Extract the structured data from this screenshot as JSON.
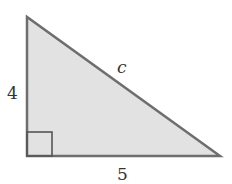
{
  "diagram": {
    "type": "right-triangle",
    "colors": {
      "fill": "#e2e2e2",
      "stroke": "#6e6e6e",
      "text": "#333333"
    },
    "vertices": {
      "top": [
        27,
        17
      ],
      "bottom_left": [
        27,
        156
      ],
      "bottom_right": [
        220,
        156
      ]
    },
    "right_angle_marker": {
      "x": 27,
      "y": 132,
      "size": 25
    },
    "labels": {
      "vertical_side": "4",
      "horizontal_side": "5",
      "hypotenuse": "c"
    }
  }
}
